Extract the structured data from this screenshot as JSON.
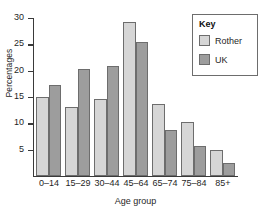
{
  "chart_data": {
    "type": "bar",
    "title": "",
    "xlabel": "Age group",
    "ylabel": "Percentages",
    "categories": [
      "0–14",
      "15–29",
      "30–44",
      "45–64",
      "65–74",
      "75–84",
      "85+"
    ],
    "series": [
      {
        "name": "Rother",
        "color": "#d6d6d6",
        "values": [
          15.0,
          13.1,
          14.6,
          29.2,
          13.6,
          10.2,
          5.0
        ]
      },
      {
        "name": "UK",
        "color": "#9d9d9d",
        "values": [
          17.3,
          20.3,
          20.9,
          25.4,
          8.7,
          5.7,
          2.5
        ]
      }
    ],
    "ylim": [
      0,
      30
    ],
    "yticks": [
      5,
      10,
      15,
      20,
      25,
      30
    ],
    "ytick_labels": [
      "5",
      "10",
      "15",
      "20",
      "25",
      "30"
    ],
    "grid": false,
    "legend": {
      "title": "Key",
      "position": "top-right"
    }
  }
}
